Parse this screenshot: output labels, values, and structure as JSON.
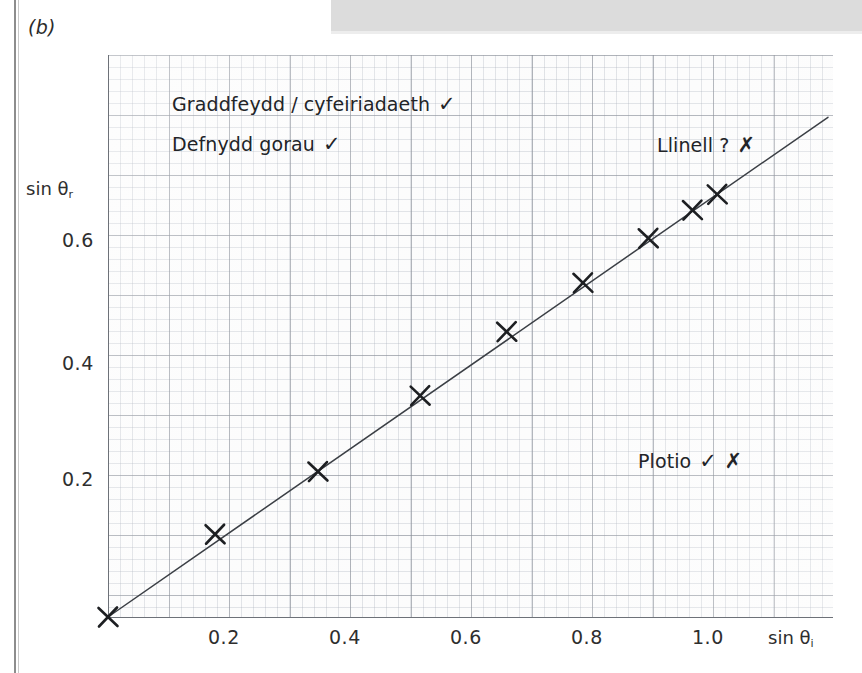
{
  "page": {
    "part_label": "(b)",
    "background_color": "#ffffff",
    "scan_bar_color": "#dcdcdc",
    "ink_color": "#232323",
    "grid_major_color": "#787d87",
    "grid_minor_color": "#969eac"
  },
  "axes": {
    "y_title": "sin θ",
    "y_title_sub": "r",
    "x_title": "sin θ",
    "x_title_sub": "i",
    "x_tick_labels": [
      "0.2",
      "0.4",
      "0.6",
      "0.8",
      "1.0"
    ],
    "y_tick_labels": [
      "0.2",
      "0.4",
      "0.6"
    ]
  },
  "annotations": [
    {
      "id": "grad-cyfeiriadaeth",
      "text": "Graddfeydd / cyfeiriadaeth",
      "mark": "✓"
    },
    {
      "id": "defnydd-gorau",
      "text": "Defnydd gorau",
      "mark": "✓"
    },
    {
      "id": "llinell",
      "text": "Llinell ?",
      "mark": "✗"
    },
    {
      "id": "plotio",
      "text": "Plotio",
      "mark": "✓ ✗"
    }
  ],
  "chart_data": {
    "type": "scatter",
    "title": "",
    "xlabel": "sin θi",
    "ylabel": "sin θr",
    "xlim": [
      0.0,
      1.2
    ],
    "ylim": [
      0.0,
      0.93
    ],
    "grid": true,
    "legend": "none",
    "marker": "x",
    "x": [
      0.0,
      0.177,
      0.347,
      0.516,
      0.659,
      0.785,
      0.893,
      0.966,
      1.007
    ],
    "y": [
      0.0,
      0.132,
      0.232,
      0.353,
      0.455,
      0.533,
      0.604,
      0.649,
      0.674
    ],
    "series": [
      {
        "name": "measured points",
        "x": [
          0.0,
          0.177,
          0.347,
          0.516,
          0.659,
          0.785,
          0.893,
          0.966,
          1.007
        ],
        "y": [
          0.0,
          0.132,
          0.232,
          0.353,
          0.455,
          0.533,
          0.604,
          0.649,
          0.674
        ]
      }
    ],
    "fit_line": {
      "name": "line of best fit",
      "x0": 0.0,
      "y0": 0.0,
      "x1": 1.19,
      "y1": 0.797,
      "slope": 0.67,
      "intercept": 0.0
    },
    "x_ticks": [
      0.2,
      0.4,
      0.6,
      0.8,
      1.0
    ],
    "y_ticks": [
      0.2,
      0.4,
      0.6
    ]
  }
}
